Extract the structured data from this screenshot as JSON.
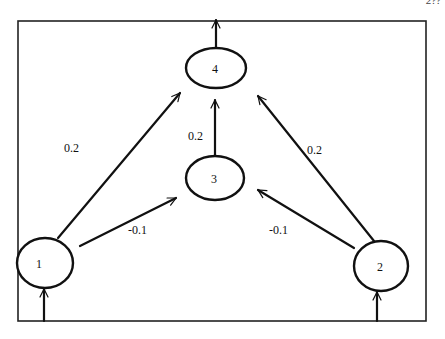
{
  "page": {
    "number_fragment": "2??"
  },
  "diagram": {
    "type": "neural-network",
    "frame": {
      "x": 18,
      "y": 20,
      "width": 408,
      "height": 301
    },
    "nodes": [
      {
        "id": "1",
        "label": "1",
        "cx": 45,
        "cy": 263,
        "rx": 28,
        "ry": 25
      },
      {
        "id": "2",
        "label": "2",
        "cx": 381,
        "cy": 266,
        "rx": 27,
        "ry": 25
      },
      {
        "id": "3",
        "label": "3",
        "cx": 215,
        "cy": 178,
        "rx": 29,
        "ry": 22
      },
      {
        "id": "4",
        "label": "4",
        "cx": 216,
        "cy": 68,
        "rx": 30,
        "ry": 20
      }
    ],
    "edges": [
      {
        "from": "1",
        "to": "4",
        "weight": "0.2",
        "label_x": 64,
        "label_y": 150
      },
      {
        "from": "1",
        "to": "3",
        "weight": "-0.1",
        "label_x": 128,
        "label_y": 232
      },
      {
        "from": "3",
        "to": "4",
        "weight": "0.2",
        "label_x": 188,
        "label_y": 138
      },
      {
        "from": "2",
        "to": "4",
        "weight": "0.2",
        "label_x": 307,
        "label_y": 154
      },
      {
        "from": "2",
        "to": "3",
        "weight": "-0.1",
        "label_x": 270,
        "label_y": 233
      }
    ],
    "inputs": [
      {
        "to": "1"
      },
      {
        "to": "2"
      }
    ],
    "outputs": [
      {
        "from": "4"
      }
    ]
  }
}
